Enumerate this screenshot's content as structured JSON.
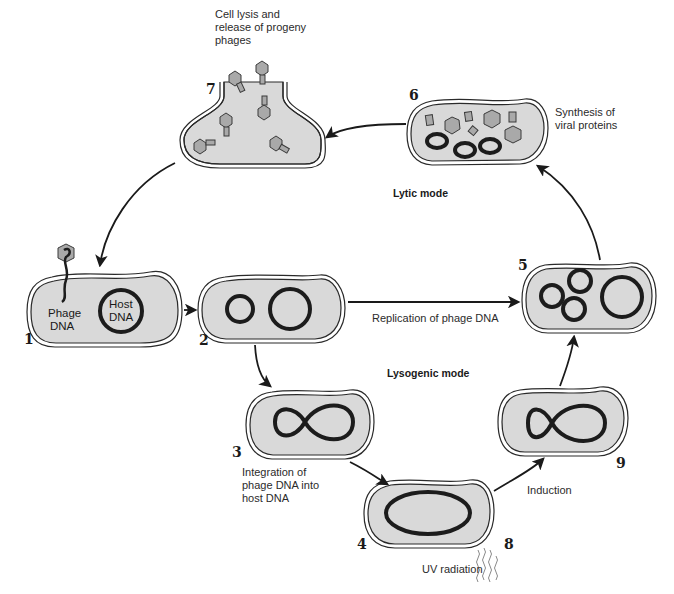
{
  "colors": {
    "cytoplasm": "#d9d9d9",
    "membrane": "#2a2a2a",
    "dna": "#1c1c1c",
    "protein": "#a9a9a9",
    "background": "#ffffff"
  },
  "modes": {
    "lytic": "Lytic mode",
    "lysogenic": "Lysogenic mode"
  },
  "stages": [
    {
      "number": "1",
      "labels": [
        "Phage",
        "DNA",
        "Host",
        "DNA"
      ]
    },
    {
      "number": "2"
    },
    {
      "number": "3",
      "caption": [
        "Integration of",
        "phage DNA into",
        "host DNA"
      ]
    },
    {
      "number": "4"
    },
    {
      "number": "5"
    },
    {
      "number": "6",
      "caption": [
        "Synthesis of",
        "viral proteins"
      ]
    },
    {
      "number": "7",
      "caption": [
        "Cell lysis and",
        "release of progeny",
        "phages"
      ]
    },
    {
      "number": "8",
      "caption": [
        "UV radiation"
      ]
    },
    {
      "number": "9"
    }
  ],
  "arrows": {
    "replication": "Replication of phage DNA",
    "induction": "Induction"
  },
  "cell1": {
    "phage_label_1": "Phage",
    "phage_label_2": "DNA",
    "host_label_1": "Host",
    "host_label_2": "DNA"
  }
}
